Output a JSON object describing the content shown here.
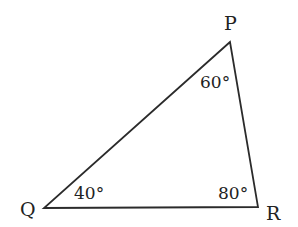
{
  "diagram": {
    "type": "triangle",
    "stroke_color": "#2b2b2b",
    "vertices": {
      "P": {
        "label": "P",
        "x": 230,
        "y": 42
      },
      "Q": {
        "label": "Q",
        "x": 44,
        "y": 208
      },
      "R": {
        "label": "R",
        "x": 258,
        "y": 207
      }
    },
    "angles": {
      "P": "60°",
      "Q": "40°",
      "R": "80°"
    }
  }
}
